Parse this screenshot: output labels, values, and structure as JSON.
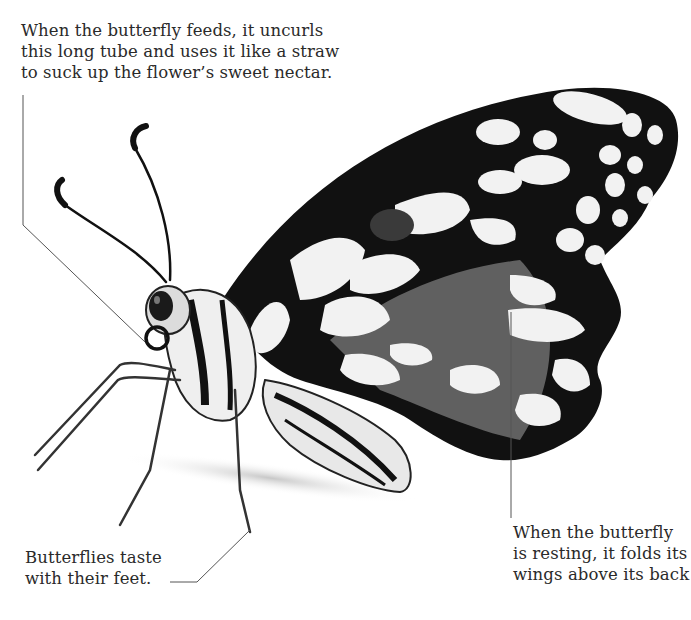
{
  "diagram": {
    "subject": "butterfly",
    "captions": {
      "feeding": "When the butterfly feeds, it uncurls\nthis long tube and uses it like a straw\nto suck up the flower’s sweet nectar.",
      "feet": "Butterflies taste\nwith their feet.",
      "resting": "When the butterfly\nis resting, it folds its\nwings above its back"
    },
    "colors": {
      "background": "#ffffff",
      "wing_black": "#111111",
      "wing_white": "#f2f2f2",
      "wing_grey": "#6e6e6e",
      "leader_line": "#555555",
      "text": "#2a2a2a"
    }
  }
}
